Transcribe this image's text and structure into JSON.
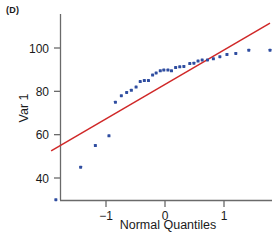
{
  "panel": {
    "label": "(D)"
  },
  "chart_data": {
    "type": "scatter",
    "title": "",
    "subtitle": "",
    "xlabel": "Normal Quantiles",
    "ylabel": "Var 1",
    "xlim": [
      -2.0,
      1.95
    ],
    "ylim": [
      27,
      112
    ],
    "xticks": [
      -1,
      0,
      1
    ],
    "xticklabels": [
      "−1",
      "0",
      "1"
    ],
    "yticks": [
      40,
      60,
      80,
      100
    ],
    "yticklabels": [
      "40",
      "60",
      "80",
      "100"
    ],
    "grid": false,
    "legend": null,
    "marker_color": "#2f4da0",
    "marker_size": 3,
    "x": [
      -1.85,
      -1.43,
      -1.18,
      -0.95,
      -0.84,
      -0.74,
      -0.65,
      -0.57,
      -0.49,
      -0.42,
      -0.35,
      -0.28,
      -0.21,
      -0.15,
      -0.08,
      -0.02,
      0.05,
      0.11,
      0.18,
      0.25,
      0.32,
      0.42,
      0.49,
      0.56,
      0.63,
      0.72,
      0.82,
      0.93,
      1.05,
      1.2,
      1.42,
      1.78
    ],
    "y": [
      30.0,
      45.0,
      55.0,
      59.5,
      75.0,
      78.0,
      79.5,
      80.5,
      82.0,
      84.5,
      85.0,
      85.0,
      87.5,
      88.5,
      89.5,
      89.8,
      89.8,
      89.5,
      91.0,
      91.3,
      91.5,
      92.8,
      93.0,
      94.0,
      94.5,
      94.5,
      95.0,
      96.0,
      97.0,
      97.5,
      99.0,
      99.0
    ],
    "reference_line": {
      "name": "normal-reference-line",
      "color": "#d02828",
      "x_start": -1.93,
      "y_start": 52.5,
      "x_end": 1.78,
      "y_end": 111.5
    },
    "annotations": []
  }
}
